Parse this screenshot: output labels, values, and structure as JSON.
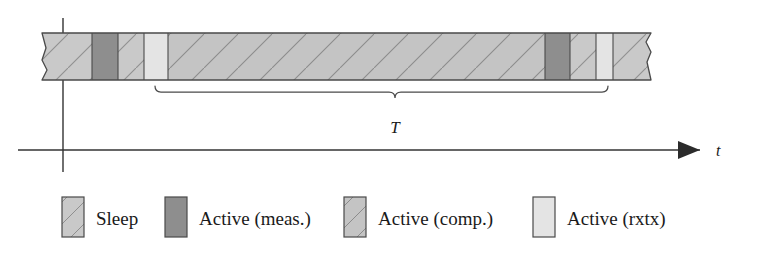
{
  "figure": {
    "type": "timeline-duty-cycle",
    "axis": {
      "time_axis_label": "t",
      "period_label": "T",
      "has_arrowhead": true,
      "has_vertical_origin_axis": true
    },
    "bar": {
      "broken_left_edge": true,
      "broken_right_edge": true,
      "segments": [
        {
          "state": "sleep",
          "label": "Sleep",
          "x": 42,
          "width": 50
        },
        {
          "state": "meas",
          "label": "Active (meas.)",
          "x": 92,
          "width": 26
        },
        {
          "state": "sleep",
          "label": "Sleep",
          "x": 118,
          "width": 26
        },
        {
          "state": "rxtx",
          "label": "Active (rxtx)",
          "x": 144,
          "width": 24
        },
        {
          "state": "comp",
          "label": "Active (comp.)",
          "x": 168,
          "width": 377
        },
        {
          "state": "meas",
          "label": "Active (meas.)",
          "x": 545,
          "width": 25
        },
        {
          "state": "sleep",
          "label": "Sleep",
          "x": 570,
          "width": 26
        },
        {
          "state": "rxtx",
          "label": "Active (rxtx)",
          "x": 596,
          "width": 17
        },
        {
          "state": "sleep",
          "label": "Sleep",
          "x": 613,
          "width": 38
        }
      ]
    },
    "brace": {
      "start_x": 155,
      "end_x": 608,
      "label": "T"
    },
    "colors": {
      "sleep": "#c9c9c9",
      "meas": "#8e8e8e",
      "comp": "#c2c2c2",
      "rxtx": "#e2e2e2",
      "outline": "#4a4a4a",
      "axis": "#333333",
      "hatch": "#8a8a8a"
    }
  },
  "legend": {
    "items": [
      {
        "key": "sleep",
        "label": "Sleep"
      },
      {
        "key": "meas",
        "label": "Active (meas.)"
      },
      {
        "key": "comp",
        "label": "Active (comp.)"
      },
      {
        "key": "rxtx",
        "label": "Active (rxtx)"
      }
    ]
  }
}
